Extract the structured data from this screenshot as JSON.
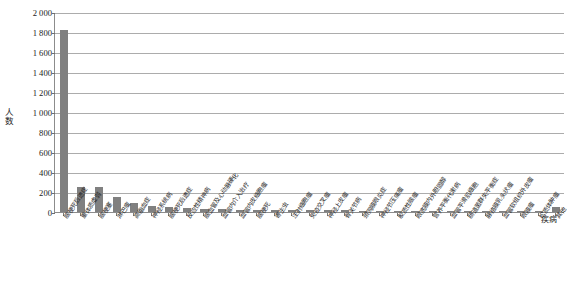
{
  "chart_data": {
    "type": "bar",
    "title": "",
    "xlabel": "疾病",
    "ylabel": "人数",
    "ylim": [
      0,
      2000
    ],
    "ytick_step": 200,
    "grid": true,
    "legend": "none",
    "bar_color": "#808080",
    "axis_color": "#8c8c8c",
    "gridline_color": "#9e9e9e",
    "ytick_labels": [
      "2 000",
      "1 800",
      "1 600",
      "1 400",
      "1 200",
      "1 000",
      "800",
      "600",
      "400",
      "200",
      "0"
    ],
    "ytick_values": [
      2000,
      1800,
      1600,
      1400,
      1200,
      1000,
      800,
      600,
      400,
      200,
      0
    ],
    "categories": [
      "脑梗死后遗症",
      "重体质虚弱",
      "脑梗塞",
      "淋巴瘤",
      "高脂血症",
      "神经系统病",
      "脑梗死后遗症",
      "反应性精神病",
      "脑血管及心动脉硬化",
      "血管内介入治疗",
      "血管内皮细胞瘤",
      "脑梗死",
      "寄生虫",
      "注射细胞瘤",
      "免疫交叉瘤",
      "神经上皮瘤",
      "骨关节病",
      "颈网膜眼炎症",
      "神经节压痛瘤",
      "胶质性脑瘤",
      "眼底膜内外胆固醇",
      "营养平衡代谢病",
      "血管平滑肌细胞",
      "肠道菌群失平衡症",
      "脉络膜乳头状瘤",
      "血管软组织外皮瘤",
      "眼膜瘤",
      "松质体肿瘤",
      "其他"
    ],
    "values": [
      1820,
      252,
      248,
      148,
      95,
      62,
      48,
      40,
      32,
      28,
      25,
      22,
      20,
      19,
      18,
      17,
      16,
      15,
      14,
      13,
      12,
      11,
      11,
      10,
      10,
      9,
      9,
      8,
      55
    ]
  }
}
